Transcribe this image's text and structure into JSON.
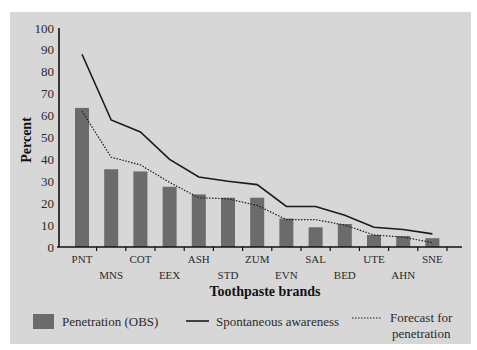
{
  "chart_data": {
    "type": "bar",
    "title": "",
    "xlabel": "Toothpaste brands",
    "ylabel": "Percent",
    "ylim": [
      0,
      100
    ],
    "yticks": [
      0,
      10,
      20,
      30,
      40,
      50,
      60,
      70,
      80,
      90,
      100
    ],
    "grid": false,
    "legend_position": "bottom",
    "categories": [
      "PNT",
      "MNS",
      "COT",
      "EEX",
      "ASH",
      "STD",
      "ZUM",
      "EVN",
      "SAL",
      "BED",
      "UTE",
      "AHN",
      "SNE"
    ],
    "series": [
      {
        "name": "Penetration (OBS)",
        "type": "bar",
        "color": "#6b6b6b",
        "values": [
          63.5,
          35.5,
          34.5,
          27.5,
          24,
          22.5,
          22.5,
          13,
          9,
          10.5,
          5.5,
          5,
          4
        ]
      },
      {
        "name": "Spontaneous awareness",
        "type": "line",
        "style": "solid",
        "color": "#1a1a1a",
        "values": [
          88,
          58,
          52.5,
          40,
          32,
          30,
          28.5,
          18.5,
          18.5,
          14.5,
          9,
          8,
          6
        ]
      },
      {
        "name": "Forecast for penetration",
        "type": "line",
        "style": "dotted",
        "color": "#1a1a1a",
        "values": [
          62,
          41,
          37.5,
          29.5,
          22.5,
          22,
          19,
          12.5,
          12.5,
          10,
          5.5,
          4.5,
          2
        ]
      }
    ],
    "legend": [
      {
        "label": "Penetration (OBS)",
        "marker": "box"
      },
      {
        "label": "Spontaneous awareness",
        "marker": "solid-line"
      },
      {
        "label": "Forecast for\npenetration",
        "marker": "dotted-line"
      }
    ]
  }
}
